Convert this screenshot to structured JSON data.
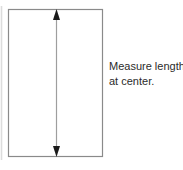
{
  "figure": {
    "title": "Measure length at center",
    "background_color": "#ffffff",
    "shape": {
      "name": "rectangle",
      "stroke_color": "#8a8a8a",
      "fill_color": "#ffffff",
      "stroke_width": 1,
      "left": 8,
      "top": 9,
      "right": 103,
      "bottom": 157
    },
    "dimension_arrow": {
      "name": "vertical-double-arrow",
      "orientation": "vertical",
      "stroke_color": "#9a9a9a",
      "arrowhead_color": "#1a1a1a",
      "x": 56,
      "y_top": 9,
      "y_bottom": 157,
      "head_top": "up",
      "head_bottom": "down"
    },
    "margin_rule": {
      "name": "page-margin-line",
      "color": "#dcdcdc",
      "x": 1,
      "y_top": 6,
      "y_bottom": 160
    },
    "annotation": {
      "color": "#2b2b2b",
      "lines": [
        "Measure length",
        "at center."
      ]
    }
  }
}
